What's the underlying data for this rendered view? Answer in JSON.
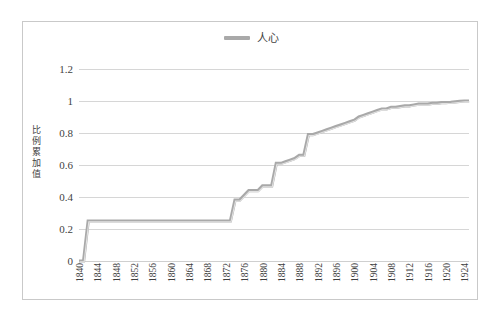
{
  "chart_data": {
    "type": "line",
    "title": "",
    "subtitle": "",
    "xlabel": "",
    "ylabel": "比例累加值",
    "xlim": [
      1840,
      1925
    ],
    "ylim": [
      0,
      1.2
    ],
    "grid": true,
    "legend_position": "top-center",
    "y_ticks": [
      "0",
      "0.2",
      "0.4",
      "0.6",
      "0.8",
      "1",
      "1.2"
    ],
    "y_tick_values": [
      0,
      0.2,
      0.4,
      0.6,
      0.8,
      1,
      1.2
    ],
    "x_tick_labels": [
      "1840",
      "1844",
      "1848",
      "1852",
      "1856",
      "1860",
      "1864",
      "1868",
      "1872",
      "1876",
      "1880",
      "1884",
      "1888",
      "1892",
      "1896",
      "1900",
      "1904",
      "1908",
      "1912",
      "1916",
      "1920",
      "1924"
    ],
    "x_tick_values": [
      1840,
      1844,
      1848,
      1852,
      1856,
      1860,
      1864,
      1868,
      1872,
      1876,
      1880,
      1884,
      1888,
      1892,
      1896,
      1900,
      1904,
      1908,
      1912,
      1916,
      1920,
      1924
    ],
    "series": [
      {
        "name": "人心",
        "color": "#a9a9a9",
        "x": [
          1840,
          1841,
          1842,
          1843,
          1844,
          1848,
          1852,
          1856,
          1860,
          1864,
          1868,
          1872,
          1873,
          1874,
          1875,
          1876,
          1877,
          1878,
          1879,
          1880,
          1881,
          1882,
          1883,
          1884,
          1885,
          1886,
          1887,
          1888,
          1889,
          1890,
          1891,
          1892,
          1893,
          1894,
          1895,
          1896,
          1897,
          1898,
          1899,
          1900,
          1901,
          1902,
          1903,
          1904,
          1905,
          1906,
          1907,
          1908,
          1909,
          1910,
          1911,
          1912,
          1913,
          1914,
          1915,
          1916,
          1917,
          1918,
          1919,
          1920,
          1921,
          1922,
          1923,
          1924,
          1925
        ],
        "y": [
          0,
          0,
          0.25,
          0.25,
          0.25,
          0.25,
          0.25,
          0.25,
          0.25,
          0.25,
          0.25,
          0.25,
          0.25,
          0.38,
          0.38,
          0.41,
          0.44,
          0.44,
          0.44,
          0.47,
          0.47,
          0.47,
          0.61,
          0.61,
          0.62,
          0.63,
          0.64,
          0.66,
          0.66,
          0.79,
          0.79,
          0.8,
          0.81,
          0.82,
          0.83,
          0.84,
          0.85,
          0.86,
          0.87,
          0.88,
          0.9,
          0.91,
          0.92,
          0.93,
          0.94,
          0.95,
          0.95,
          0.96,
          0.96,
          0.965,
          0.97,
          0.97,
          0.975,
          0.98,
          0.98,
          0.98,
          0.985,
          0.985,
          0.99,
          0.99,
          0.992,
          0.995,
          0.998,
          1.0,
          1.0
        ]
      }
    ]
  },
  "legend": {
    "label": "人心"
  },
  "axis": {
    "y_title_chars": [
      "比",
      "例",
      "累",
      "加",
      "值"
    ]
  }
}
